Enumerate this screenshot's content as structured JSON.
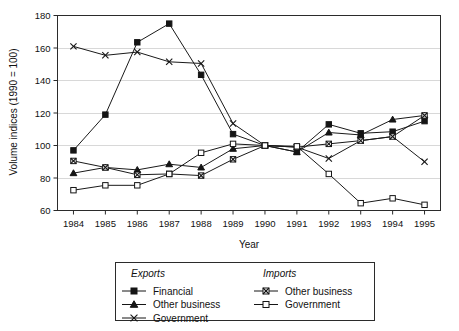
{
  "chart_data": {
    "type": "line",
    "title": "",
    "xlabel": "Year",
    "ylabel": "Volume indices (1990 = 100)",
    "categories": [
      "1984",
      "1985",
      "1986",
      "1987",
      "1988",
      "1989",
      "1990",
      "1991",
      "1992",
      "1993",
      "1994",
      "1995"
    ],
    "x": [
      1984,
      1985,
      1986,
      1987,
      1988,
      1989,
      1990,
      1991,
      1992,
      1993,
      1994,
      1995
    ],
    "xlim": [
      1984,
      1995
    ],
    "ylim": [
      60,
      180
    ],
    "yticks": [
      60,
      80,
      100,
      120,
      140,
      160,
      180
    ],
    "ytick_labels": [
      "60",
      "80",
      "100",
      "120",
      "140",
      "160",
      "180"
    ],
    "grid": true,
    "grid_axis": "y",
    "legend_position": "below",
    "series": [
      {
        "name": "Financial",
        "group": "Exports",
        "marker": "filled-square",
        "values": [
          97,
          119,
          163.5,
          175,
          143.5,
          107,
          100,
          96,
          113,
          107.5,
          108.5,
          115
        ]
      },
      {
        "name": "Other business",
        "group": "Exports",
        "marker": "filled-triangle",
        "values": [
          83,
          86.5,
          85,
          88.5,
          86.5,
          98,
          100,
          96,
          108,
          106.5,
          116,
          118.5
        ]
      },
      {
        "name": "Government",
        "group": "Exports",
        "marker": "cross-x",
        "values": [
          161,
          155.5,
          157.5,
          151.5,
          150.5,
          113.5,
          100,
          99,
          92,
          103,
          105.5,
          90
        ]
      },
      {
        "name": "Other business",
        "group": "Imports",
        "marker": "x-in-square",
        "values": [
          90.5,
          86.5,
          82,
          82.5,
          81.5,
          91.5,
          100,
          99,
          101,
          103,
          105.5,
          118.5
        ]
      },
      {
        "name": "Government",
        "group": "Imports",
        "marker": "open-square",
        "values": [
          72.5,
          75.5,
          75.5,
          82.5,
          95.5,
          101,
          100,
          99.5,
          82.5,
          64.5,
          67.5,
          63.5
        ]
      }
    ]
  },
  "legend": {
    "groups": [
      {
        "heading": "Exports",
        "entries": [
          {
            "label": "Financial",
            "marker": "filled-square"
          },
          {
            "label": "Other business",
            "marker": "filled-triangle"
          },
          {
            "label": "Government",
            "marker": "cross-x"
          }
        ]
      },
      {
        "heading": "Imports",
        "entries": [
          {
            "label": "Other business",
            "marker": "x-in-square"
          },
          {
            "label": "Government",
            "marker": "open-square"
          }
        ]
      }
    ]
  },
  "colors": {
    "ink": "#151515",
    "frame": "#2b2b2b",
    "grid": "#d8d8d8",
    "background": "#ffffff"
  }
}
